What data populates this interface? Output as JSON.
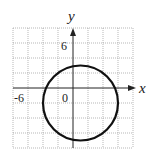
{
  "axes": {
    "x_label": "x",
    "y_label": "y",
    "x_tick": "-6",
    "y_tick": "6",
    "origin": "0"
  },
  "grid": {
    "xmin": -8,
    "xmax": 8,
    "ymin": -10,
    "ymax": 8,
    "step": 2
  },
  "circle": {
    "center": [
      1,
      -2
    ],
    "radius": 5
  }
}
